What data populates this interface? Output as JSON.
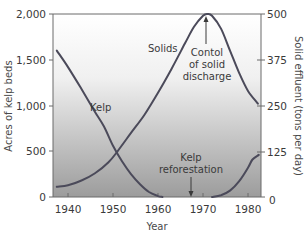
{
  "chart_data": {
    "type": "line",
    "title": "",
    "xlabel": "Year",
    "ylabel": "Acres of kelp beds",
    "ylabel_right": "Solid effluent (tons per day)",
    "xlim": [
      1936.7,
      1982.9
    ],
    "ylim": [
      0,
      2000
    ],
    "ylim_right": [
      0,
      500
    ],
    "x_ticks": [
      1940,
      1950,
      1960,
      1970,
      1980
    ],
    "y_ticks": [
      0,
      500,
      1000,
      1500,
      2000
    ],
    "y_tick_labels": [
      "0",
      "500",
      "1,000",
      "1,500",
      "2,000"
    ],
    "y_ticks_right": [
      0,
      125,
      250,
      375,
      500
    ],
    "y_tick_labels_right": [
      "0",
      "125",
      "250",
      "375",
      "500"
    ],
    "grid": false,
    "legend": null,
    "series": [
      {
        "name": "Kelp",
        "axis": "left",
        "unit": "acres",
        "x": [
          1937.5,
          1940,
          1943,
          1946,
          1948,
          1950,
          1952,
          1954,
          1956,
          1958,
          1960,
          1961
        ],
        "values": [
          1600,
          1420,
          1180,
          930,
          770,
          560,
          390,
          250,
          140,
          55,
          10,
          0
        ]
      },
      {
        "name": "Kelp (recovery)",
        "axis": "left",
        "unit": "acres",
        "x": [
          1972,
          1974,
          1976,
          1978,
          1980,
          1981,
          1982.4
        ],
        "values": [
          0,
          20,
          70,
          170,
          320,
          410,
          460
        ]
      },
      {
        "name": "Solids",
        "axis": "right",
        "unit": "tons per day",
        "x": [
          1937.5,
          1940,
          1943,
          1946,
          1949,
          1951,
          1954,
          1957,
          1960,
          1963,
          1966,
          1968,
          1970,
          1971,
          1972,
          1974,
          1976,
          1978,
          1980,
          1982.2
        ],
        "values": [
          28,
          32,
          45,
          65,
          95,
          125,
          175,
          225,
          285,
          350,
          420,
          465,
          495,
          500,
          495,
          460,
          400,
          340,
          290,
          255
        ]
      }
    ],
    "annotations": [
      {
        "text": "Kelp",
        "x": 1952,
        "y_left": 950
      },
      {
        "text": "Solids",
        "x": 1962.5,
        "y_left": 1700
      },
      {
        "text": [
          "Contol",
          "of solid",
          "discharge"
        ],
        "arrow_to": {
          "x": 1971,
          "y_right": 500
        }
      },
      {
        "text": [
          "Kelp",
          "reforestation"
        ],
        "arrow_to": {
          "x": 1967.5,
          "y_left": 0
        }
      }
    ]
  },
  "labels": {
    "xlabel": "Year",
    "ylabel_left": "Acres of kelp beds",
    "ylabel_right": "Solid effluent (tons per day)",
    "kelp_label": "Kelp",
    "solids_label": "Solids",
    "control_line1": "Contol",
    "control_line2": "of solid",
    "control_line3": "discharge",
    "refor_line1": "Kelp",
    "refor_line2": "reforestation",
    "x_tick_1940": "1940",
    "x_tick_1950": "1950",
    "x_tick_1960": "1960",
    "x_tick_1970": "1970",
    "x_tick_1980": "1980",
    "yl_0": "0",
    "yl_500": "500",
    "yl_1000": "1,000",
    "yl_1500": "1,500",
    "yl_2000": "2,000",
    "yr_0": "0",
    "yr_125": "125",
    "yr_250": "250",
    "yr_375": "375",
    "yr_500": "500"
  },
  "colors": {
    "curve": "#4b4a5a",
    "gradient_top": "#ffffff",
    "gradient_bottom": "#9c9c9c",
    "axis": "#6a6a6a",
    "text": "#3a3a3a"
  }
}
